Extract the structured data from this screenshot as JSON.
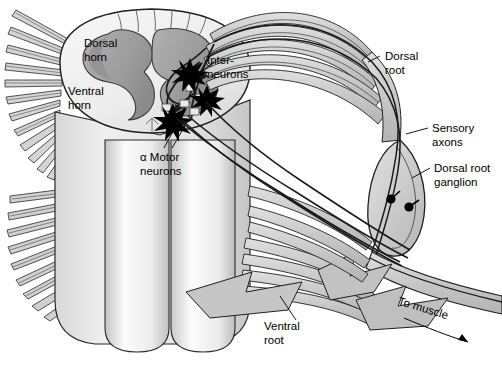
{
  "figure": {
    "type": "anatomical-illustration",
    "style": "grayscale line drawing",
    "background_color": "#ffffff",
    "palette": {
      "outline": "#1a1a1a",
      "white_matter": "#f2f2f2",
      "gray_matter": "#a8a8a8",
      "gray_matter_dark": "#8d8d8d",
      "nerve_fill": "#c9c9c9",
      "nerve_fill_light": "#dcdcdc",
      "ganglion_fill": "#d2d2d2",
      "neuron_black": "#000000",
      "column_light": "#fbfbfb",
      "column_shade": "#d6d6d6"
    }
  },
  "labels": {
    "dorsal_horn": {
      "line1": "Dorsal",
      "line2": "horn"
    },
    "ventral_horn": {
      "line1": "Ventral",
      "line2": "horn"
    },
    "interneurons": {
      "line1": "Inter-",
      "line2": "neurons"
    },
    "motor_neurons": {
      "line1": "α Motor",
      "line2": "neurons"
    },
    "dorsal_root": {
      "line1": "Dorsal",
      "line2": "root"
    },
    "sensory_axons": {
      "line1": "Sensory",
      "line2": "axons"
    },
    "dorsal_root_ganglion": {
      "line1": "Dorsal root",
      "line2": "ganglion"
    },
    "ventral_root": {
      "line1": "Ventral",
      "line2": "root"
    },
    "to_muscle": {
      "line1": "To muscle"
    }
  },
  "structures": {
    "spinal_cord": "spinal cord segment shown in oblique cut-away view",
    "gray_matter": "butterfly-shaped central gray matter",
    "dorsal_rootlets": "fine filaments fanning dorsally from cord",
    "ventral_rootlets": "fine filaments fanning ventrally from cord",
    "ganglion_cell_bodies": 2,
    "neuron_somas": 3,
    "neuron_soma_shape": "star",
    "arrow": "to-muscle direction arrow at lower right"
  }
}
